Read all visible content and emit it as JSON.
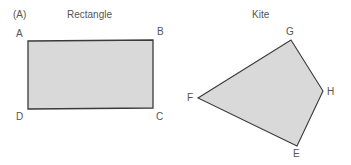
{
  "panel_label": "(A)",
  "shapes": [
    {
      "title": "Rectangle",
      "vertices": [
        {
          "label": "A",
          "x": 28,
          "y": 41
        },
        {
          "label": "B",
          "x": 153,
          "y": 40
        },
        {
          "label": "C",
          "x": 153,
          "y": 108
        },
        {
          "label": "D",
          "x": 28,
          "y": 109
        }
      ]
    },
    {
      "title": "Kite",
      "vertices": [
        {
          "label": "G",
          "x": 291,
          "y": 40
        },
        {
          "label": "H",
          "x": 323,
          "y": 91
        },
        {
          "label": "E",
          "x": 297,
          "y": 146
        },
        {
          "label": "F",
          "x": 198,
          "y": 98
        }
      ]
    }
  ],
  "colors": {
    "fill": "#d9d9d9",
    "stroke": "#3a3a3a"
  }
}
